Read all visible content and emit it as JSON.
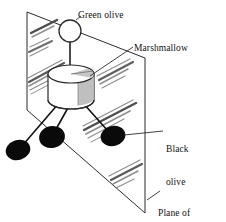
{
  "figure": {
    "background_color": "#ffffff",
    "line_color": "#111111",
    "hatch_color": "#8c8c8c",
    "olive_fill": "#0a0a0a",
    "marshmallow_fill": "#ffffff",
    "marshmallow_shade": "#b9b9b9"
  },
  "labels": {
    "green_olive": "Green olive",
    "marshmallow": "Marshmallow",
    "black_olive_line1": "Black",
    "black_olive_line2": "olive",
    "plane_line1": "Plane of",
    "plane_line2": "symmetry"
  },
  "parts": {
    "plane": {
      "name": "Plane of symmetry",
      "shape": "parallelogram",
      "corners": [
        [
          27,
          12
        ],
        [
          145,
          58
        ],
        [
          145,
          213
        ],
        [
          27,
          110
        ]
      ]
    },
    "marshmallow": {
      "name": "Marshmallow",
      "shape": "cylinder",
      "center": [
        71,
        88
      ]
    },
    "green_olive": {
      "name": "Green olive",
      "shape": "open-circle",
      "center": [
        70,
        31
      ],
      "radius": 11
    },
    "black_olives": [
      {
        "name": "Black olive (front left)",
        "center": [
          18,
          150
        ],
        "rx": 12,
        "ry": 10
      },
      {
        "name": "Black olive (center)",
        "center": [
          52,
          137
        ],
        "rx": 13,
        "ry": 11
      },
      {
        "name": "Black olive (right)",
        "center": [
          113,
          136
        ],
        "rx": 12,
        "ry": 10
      }
    ]
  }
}
